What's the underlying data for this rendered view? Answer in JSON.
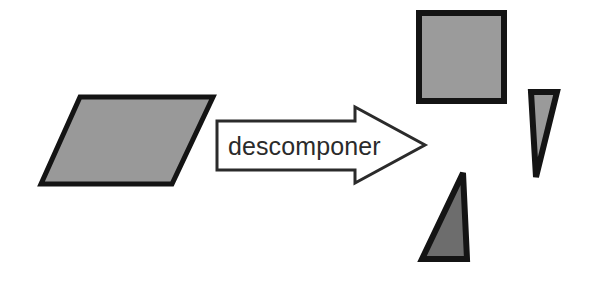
{
  "figure": {
    "background_color": "#ffffff",
    "outline_color": "#141414",
    "arrow": {
      "label": "descomponer",
      "label_color": "#2b2b2b",
      "fill": "#ffffff",
      "stroke": "#2b2b2b",
      "direction": "right"
    },
    "shapes": [
      {
        "name": "parallelogram",
        "role": "source-shape",
        "fill": "#999999",
        "stroke": "#141414",
        "points": "80,97 213,97 172,184 41,184"
      },
      {
        "name": "square",
        "role": "decomposed-part",
        "fill": "#9b9b9b",
        "stroke": "#141414",
        "points": "419,13 504,13 504,101 419,101"
      },
      {
        "name": "triangle-right",
        "role": "decomposed-part",
        "fill": "#9a9a9a",
        "stroke": "#141414",
        "points": "531,92 557,92 536,177"
      },
      {
        "name": "triangle-bottom",
        "role": "decomposed-part",
        "fill": "#6d6d6d",
        "stroke": "#141414",
        "points": "463,173 467,259 422,259"
      }
    ]
  }
}
